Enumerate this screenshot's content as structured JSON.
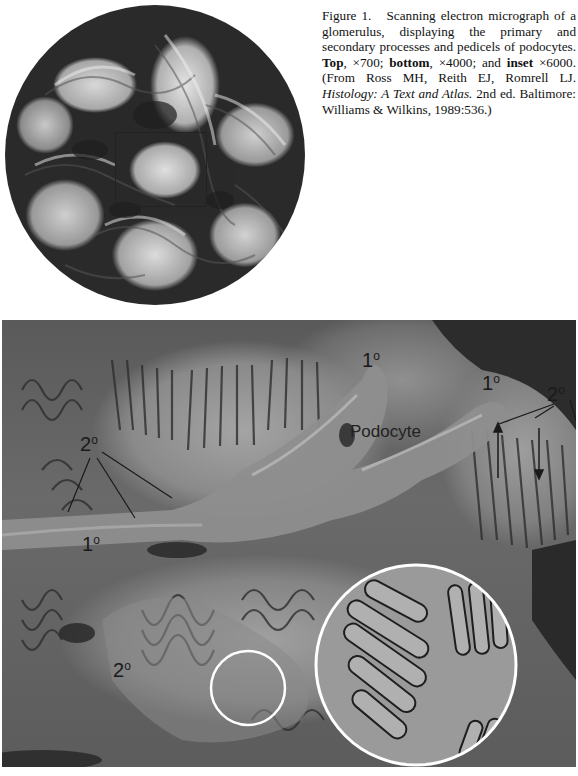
{
  "figure": {
    "label": "Figure 1.",
    "caption_parts": {
      "lead": "Scanning electron micrograph of a glomerulus, displaying the primary and secondary processes and pedicels of podocytes.",
      "top_label": "Top",
      "top_mag": ", ×700; ",
      "bottom_label": "bottom",
      "bottom_mag": ", ×4000; and ",
      "inset_label": "inset",
      "inset_mag": " ×6000. (From Ross MH, Reith EJ, Romrell LJ. ",
      "book_title": "Histology: A Text and Atlas.",
      "citation_tail": " 2nd ed. Baltimore: Williams & Wilkins, 1989:536.)"
    }
  },
  "top_image": {
    "description": "glomerulus-overview-x700",
    "box_region": {
      "x": 115,
      "y": 132,
      "w": 90,
      "h": 73
    }
  },
  "bottom_image": {
    "description": "podocyte-processes-x4000",
    "labels": [
      {
        "id": "primary-1",
        "text": "1",
        "sup": "o",
        "x": 362,
        "y": 346
      },
      {
        "id": "primary-2",
        "text": "1",
        "sup": "o",
        "x": 482,
        "y": 369
      },
      {
        "id": "secondary-right",
        "text": "2",
        "sup": "o",
        "x": 547,
        "y": 380
      },
      {
        "id": "secondary-left",
        "text": "2",
        "sup": "o",
        "x": 80,
        "y": 430
      },
      {
        "id": "primary-left",
        "text": "1",
        "sup": "o",
        "x": 82,
        "y": 530
      },
      {
        "id": "secondary-bottom",
        "text": "2",
        "sup": "o",
        "x": 113,
        "y": 656
      }
    ],
    "podocyte_label": {
      "text": "Podocyte",
      "x": 350,
      "y": 421
    },
    "small_circle": {
      "cx": 248,
      "cy": 688,
      "r": 37
    },
    "inset_circle": {
      "cx": 416,
      "cy": 665,
      "r": 100
    }
  },
  "colors": {
    "background": "#ffffff",
    "caption_text": "#111111",
    "circle_stroke": "#ffffff",
    "label_text": "#1a1a1a"
  }
}
